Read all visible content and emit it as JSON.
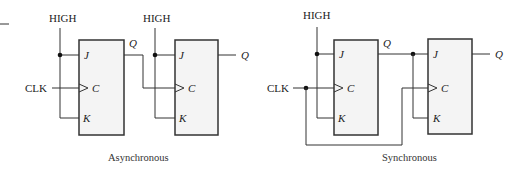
{
  "diagram": {
    "colors": {
      "line": "#333333",
      "box_fill": "#f4f4f4",
      "text": "#222222"
    },
    "asynchronous": {
      "caption": "Asynchronous",
      "ff1": {
        "high_label": "HIGH",
        "clk_label": "CLK",
        "pin_j": "J",
        "pin_c": "C",
        "pin_k": "K",
        "out_label": "Q"
      },
      "ff2": {
        "high_label": "HIGH",
        "pin_j": "J",
        "pin_c": "C",
        "pin_k": "K",
        "out_label": "Q"
      }
    },
    "synchronous": {
      "caption": "Synchronous",
      "ff1": {
        "high_label": "HIGH",
        "clk_label": "CLK",
        "pin_j": "J",
        "pin_c": "C",
        "pin_k": "K",
        "out_label": "Q"
      },
      "ff2": {
        "pin_j": "J",
        "pin_c": "C",
        "pin_k": "K",
        "out_label": "Q"
      }
    }
  }
}
